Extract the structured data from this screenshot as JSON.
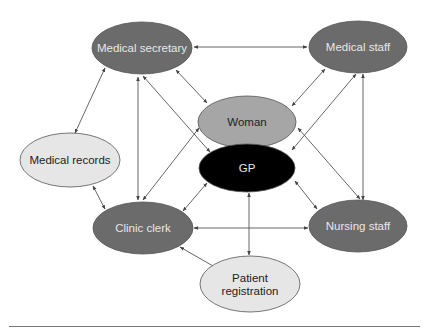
{
  "diagram": {
    "colors": {
      "dark_node": "#6b6b6b",
      "mid_node": "#a6a6a6",
      "light_node": "#e6e6e6",
      "gp_node": "#000000",
      "dark_text": "#e8e8e8",
      "light_text": "#222222",
      "edge": "#555555"
    },
    "nodes": [
      {
        "id": "medical-secretary",
        "label": "Medical secretary",
        "cx": 142,
        "cy": 48,
        "rx": 50,
        "ry": 26,
        "shade": "dark"
      },
      {
        "id": "medical-staff",
        "label": "Medical staff",
        "cx": 358,
        "cy": 47,
        "rx": 49,
        "ry": 26,
        "shade": "dark"
      },
      {
        "id": "woman",
        "label": "Woman",
        "cx": 247,
        "cy": 122,
        "rx": 49,
        "ry": 26,
        "shade": "mid"
      },
      {
        "id": "gp",
        "label": "GP",
        "cx": 247,
        "cy": 168,
        "rx": 48,
        "ry": 24,
        "shade": "gp"
      },
      {
        "id": "medical-records",
        "label": "Medical records",
        "cx": 70,
        "cy": 160,
        "rx": 50,
        "ry": 27,
        "shade": "light"
      },
      {
        "id": "clinic-clerk",
        "label": "Clinic clerk",
        "cx": 143,
        "cy": 228,
        "rx": 50,
        "ry": 26,
        "shade": "dark"
      },
      {
        "id": "nursing-staff",
        "label": "Nursing staff",
        "cx": 358,
        "cy": 226,
        "rx": 49,
        "ry": 26,
        "shade": "dark"
      },
      {
        "id": "patient-registration",
        "label": "Patient registration",
        "label_lines": [
          "Patient",
          "registration"
        ],
        "cx": 250,
        "cy": 284,
        "rx": 50,
        "ry": 28,
        "shade": "light"
      }
    ],
    "edges": [
      {
        "from": "medical-secretary",
        "to": "medical-staff",
        "x1": 194,
        "y1": 47,
        "x2": 307,
        "y2": 47
      },
      {
        "from": "medical-secretary",
        "to": "medical-records",
        "x1": 105,
        "y1": 68,
        "x2": 75,
        "y2": 133
      },
      {
        "from": "medical-secretary",
        "to": "clinic-clerk",
        "x1": 138,
        "y1": 77,
        "x2": 138,
        "y2": 200
      },
      {
        "from": "medical-secretary",
        "to": "woman",
        "x1": 176,
        "y1": 70,
        "x2": 207,
        "y2": 103
      },
      {
        "from": "medical-secretary",
        "to": "gp",
        "x1": 143,
        "y1": 76,
        "x2": 210,
        "y2": 152
      },
      {
        "from": "medical-staff",
        "to": "woman",
        "x1": 325,
        "y1": 69,
        "x2": 292,
        "y2": 106
      },
      {
        "from": "medical-staff",
        "to": "gp",
        "x1": 356,
        "y1": 74,
        "x2": 292,
        "y2": 150
      },
      {
        "from": "medical-staff",
        "to": "nursing-staff",
        "x1": 363,
        "y1": 74,
        "x2": 363,
        "y2": 200
      },
      {
        "from": "woman",
        "to": "clinic-clerk",
        "x1": 199,
        "y1": 128,
        "x2": 143,
        "y2": 200
      },
      {
        "from": "woman",
        "to": "nursing-staff",
        "x1": 298,
        "y1": 128,
        "x2": 360,
        "y2": 199
      },
      {
        "from": "gp",
        "to": "clinic-clerk",
        "x1": 207,
        "y1": 183,
        "x2": 183,
        "y2": 211
      },
      {
        "from": "gp",
        "to": "nursing-staff",
        "x1": 295,
        "y1": 181,
        "x2": 317,
        "y2": 209
      },
      {
        "from": "gp",
        "to": "patient-registration",
        "x1": 249,
        "y1": 193,
        "x2": 249,
        "y2": 255
      },
      {
        "from": "medical-records",
        "to": "clinic-clerk",
        "x1": 93,
        "y1": 186,
        "x2": 105,
        "y2": 209
      },
      {
        "from": "clinic-clerk",
        "to": "nursing-staff",
        "x1": 194,
        "y1": 228,
        "x2": 308,
        "y2": 228
      },
      {
        "from": "clinic-clerk",
        "to": "patient-registration",
        "x1": 180,
        "y1": 247,
        "x2": 220,
        "y2": 270
      }
    ]
  }
}
